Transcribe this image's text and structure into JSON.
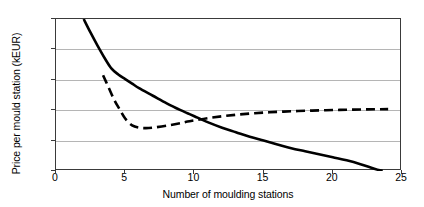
{
  "chart_data": {
    "type": "line",
    "title": "",
    "xlabel": "Number of moulding stations",
    "ylabel": "Price per mould station (kEUR)",
    "xlim": [
      0,
      25
    ],
    "ylim": [
      70,
      170
    ],
    "grid": true,
    "legend": "none",
    "xticks": [
      "0",
      "5",
      "10",
      "15",
      "20",
      "25"
    ],
    "xtick_values": [
      0,
      5,
      10,
      15,
      20,
      25
    ],
    "yticks": [
      "70",
      "90",
      "110",
      "130",
      "150",
      "170"
    ],
    "ytick_values": [
      70,
      90,
      110,
      130,
      150,
      170
    ],
    "gridline_values": [
      90,
      110,
      130,
      150
    ],
    "series": [
      {
        "name": "solid-curve",
        "style": "solid",
        "color": "#000000",
        "width": 2.6,
        "x": [
          2.0,
          2.5,
          3.0,
          3.5,
          4.0,
          4.5,
          5.0,
          5.5,
          6.0,
          7.0,
          8.0,
          9.0,
          9.5,
          10.0,
          11.0,
          12.0,
          13.0,
          14.0,
          15.0,
          16.0,
          17.0,
          18.0,
          19.0,
          20.0,
          21.0,
          22.0,
          23.0,
          23.6
        ],
        "values": [
          170.0,
          161.0,
          152.5,
          144.5,
          137.5,
          133.5,
          130.5,
          127.5,
          124.5,
          119.5,
          114.5,
          110.0,
          108.0,
          106.0,
          102.0,
          98.5,
          95.5,
          92.5,
          90.0,
          87.5,
          85.0,
          83.0,
          81.0,
          79.0,
          77.0,
          74.5,
          71.5,
          70.0
        ]
      },
      {
        "name": "dashed-curve",
        "style": "dashed",
        "color": "#000000",
        "width": 2.6,
        "dash_pattern": "9 5",
        "x": [
          3.4,
          3.8,
          4.2,
          4.6,
          5.0,
          5.5,
          6.0,
          6.5,
          7.0,
          8.0,
          9.0,
          9.5,
          10.0,
          11.0,
          12.0,
          13.0,
          14.0,
          15.0,
          16.0,
          17.0,
          18.0,
          19.0,
          20.0,
          21.0,
          22.0,
          23.0,
          24.0
        ],
        "values": [
          133.0,
          125.0,
          117.0,
          110.5,
          104.5,
          100.0,
          98.5,
          98.2,
          98.5,
          99.8,
          101.5,
          102.5,
          103.3,
          104.8,
          106.0,
          107.0,
          107.8,
          108.4,
          108.9,
          109.3,
          109.6,
          109.9,
          110.1,
          110.3,
          110.5,
          110.6,
          110.7
        ]
      }
    ]
  }
}
